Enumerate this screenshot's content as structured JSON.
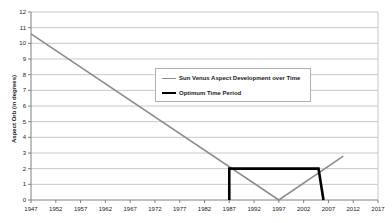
{
  "chart_data": {
    "type": "line",
    "title": "",
    "xlabel": "",
    "ylabel": "Aspect Orb (in degrees)",
    "xlim": [
      1947,
      2017
    ],
    "ylim": [
      0,
      12
    ],
    "grid": true,
    "legend_position": "center",
    "x_ticks": [
      1947,
      1952,
      1957,
      1962,
      1967,
      1972,
      1977,
      1982,
      1987,
      1992,
      1997,
      2002,
      2007,
      2012,
      2017
    ],
    "y_ticks": [
      0,
      1,
      2,
      3,
      4,
      5,
      6,
      7,
      8,
      9,
      10,
      11,
      12
    ],
    "series": [
      {
        "name": "Sun Venus Aspect Development over Time",
        "color": "#8c8c8c",
        "width": 1.6,
        "points": [
          [
            1947,
            10.6
          ],
          [
            1997,
            0.0
          ],
          [
            2010,
            2.8
          ]
        ]
      },
      {
        "name": "Optimum Time Period",
        "color": "#000000",
        "width": 2.6,
        "points": [
          [
            1987,
            0.0
          ],
          [
            1987,
            2.0
          ],
          [
            2005,
            2.0
          ],
          [
            2006,
            0.0
          ]
        ]
      }
    ]
  },
  "axis": {
    "y_title": "Aspect Orb (in degrees)",
    "y_labels": [
      "12",
      "11",
      "10",
      "9",
      "8",
      "7",
      "6",
      "5",
      "4",
      "3",
      "2",
      "1",
      "0"
    ],
    "x_labels": [
      "1947",
      "1952",
      "1957",
      "1962",
      "1967",
      "1972",
      "1977",
      "1982",
      "1987",
      "1992",
      "1997",
      "2002",
      "2007",
      "2012",
      "2017"
    ]
  },
  "legend": {
    "entries": [
      {
        "label": "Sun Venus Aspect Development over Time",
        "color": "#8c8c8c"
      },
      {
        "label": "Optimum Time Period",
        "color": "#000000"
      }
    ]
  },
  "colors": {
    "series_grey": "#8c8c8c",
    "series_black": "#000000",
    "gridline": "#c8c8c8",
    "axis": "#808080",
    "background": "#ffffff",
    "text": "#1a1a1a"
  }
}
